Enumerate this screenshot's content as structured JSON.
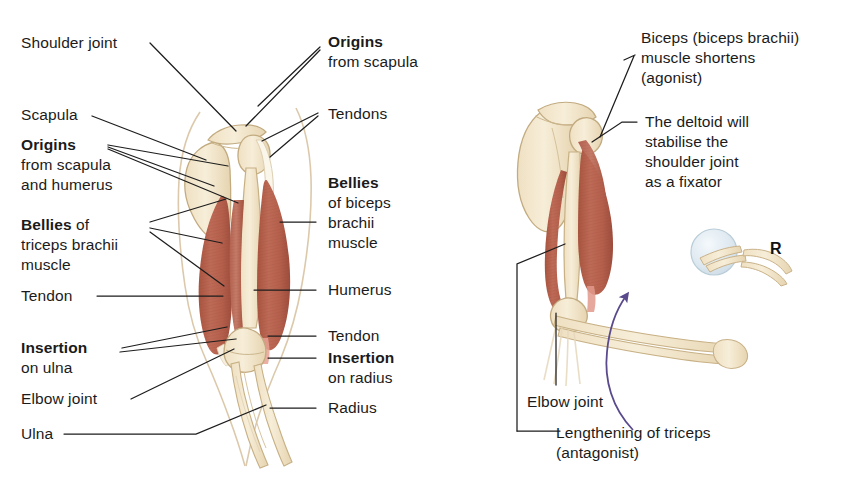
{
  "figure": {
    "title_visible": false,
    "type": "anatomical-illustration"
  },
  "colors": {
    "muscle": "#b4604e",
    "muscle_dark": "#9d4c3c",
    "muscle_light": "#c8796a",
    "bone": "#f3e7cd",
    "bone_outline": "#c9b48a",
    "tendon": "#faf3e4",
    "leader_line": "#1d1d1d",
    "arrow_purple": "#5a4a8c",
    "ball": "#e2ecf2",
    "ball_outline": "#b9cdd8",
    "skin_outline": "#d8c6a8",
    "text": "#1b1b1b"
  },
  "left_figure": {
    "name": "arm-anterior-posterior-muscles",
    "labels": [
      {
        "id": "shoulder-joint",
        "text": "Shoulder joint",
        "bold": false
      },
      {
        "id": "scapula",
        "text": "Scapula",
        "bold": false
      },
      {
        "id": "origins-scapula-humerus-bold",
        "text": "Origins",
        "bold": true
      },
      {
        "id": "origins-scapula-humerus-line2",
        "text": "from scapula",
        "bold": false
      },
      {
        "id": "origins-scapula-humerus-line3",
        "text": "and humerus",
        "bold": false
      },
      {
        "id": "bellies-triceps-bold",
        "text": "Bellies",
        "bold": true
      },
      {
        "id": "bellies-triceps-of",
        "text": " of",
        "bold": false
      },
      {
        "id": "bellies-triceps-line2",
        "text": "triceps brachii",
        "bold": false
      },
      {
        "id": "bellies-triceps-line3",
        "text": "muscle",
        "bold": false
      },
      {
        "id": "tendon-left",
        "text": "Tendon",
        "bold": false
      },
      {
        "id": "insertion-ulna-bold",
        "text": "Insertion",
        "bold": true
      },
      {
        "id": "insertion-ulna-line2",
        "text": "on ulna",
        "bold": false
      },
      {
        "id": "elbow-joint-left",
        "text": "Elbow joint",
        "bold": false
      },
      {
        "id": "ulna",
        "text": "Ulna",
        "bold": false
      },
      {
        "id": "origins-scapula-bold",
        "text": "Origins",
        "bold": true
      },
      {
        "id": "origins-scapula-line2",
        "text": "from scapula",
        "bold": false
      },
      {
        "id": "tendons",
        "text": "Tendons",
        "bold": false
      },
      {
        "id": "bellies-biceps-bold",
        "text": "Bellies",
        "bold": true
      },
      {
        "id": "bellies-biceps-line2",
        "text": "of biceps",
        "bold": false
      },
      {
        "id": "bellies-biceps-line3",
        "text": "brachii",
        "bold": false
      },
      {
        "id": "bellies-biceps-line4",
        "text": "muscle",
        "bold": false
      },
      {
        "id": "humerus",
        "text": "Humerus",
        "bold": false
      },
      {
        "id": "tendon-right",
        "text": "Tendon",
        "bold": false
      },
      {
        "id": "insertion-radius-bold",
        "text": "Insertion",
        "bold": true
      },
      {
        "id": "insertion-radius-line2",
        "text": "on radius",
        "bold": false
      },
      {
        "id": "radius",
        "text": "Radius",
        "bold": false
      }
    ]
  },
  "right_figure": {
    "name": "arm-flexion-agonist-antagonist",
    "labels": [
      {
        "id": "biceps-agonist-line1",
        "text": "Biceps (biceps brachii)"
      },
      {
        "id": "biceps-agonist-line2",
        "text": "muscle shortens"
      },
      {
        "id": "biceps-agonist-line3",
        "text": "(agonist)"
      },
      {
        "id": "deltoid-fixator-line1",
        "text": "The deltoid will"
      },
      {
        "id": "deltoid-fixator-line2",
        "text": "stabilise the"
      },
      {
        "id": "deltoid-fixator-line3",
        "text": "shoulder joint"
      },
      {
        "id": "deltoid-fixator-line4",
        "text": "as a fixator"
      },
      {
        "id": "elbow-joint-right",
        "text": "Elbow joint"
      },
      {
        "id": "lengthening-triceps-line1",
        "text": "Lengthening of triceps"
      },
      {
        "id": "lengthening-triceps-line2",
        "text": "(antagonist)"
      }
    ],
    "resistance_marker": "R",
    "movement_arrow": "curved-upward-arrow"
  }
}
